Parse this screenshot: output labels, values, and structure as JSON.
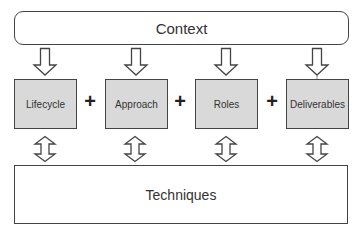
{
  "diagram": {
    "context": {
      "label": "Context"
    },
    "components": [
      {
        "label": "Lifecycle",
        "x": 14
      },
      {
        "label": "Approach",
        "x": 105
      },
      {
        "label": "Roles",
        "x": 195
      },
      {
        "label": "Deliverables",
        "x": 286
      }
    ],
    "operators": [
      {
        "symbol": "+",
        "x": 83
      },
      {
        "symbol": "+",
        "x": 173
      },
      {
        "symbol": "+",
        "x": 265
      }
    ],
    "foundation": {
      "label": "Techniques"
    },
    "arrows": {
      "context_to_components": "down-arrow",
      "components_to_techniques": "double-arrow"
    },
    "colors": {
      "component_fill": "#d9d9d9",
      "stroke": "#444444",
      "background": "#ffffff"
    }
  }
}
